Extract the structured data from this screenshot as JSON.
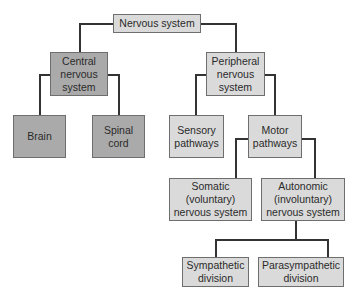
{
  "diagram": {
    "type": "hierarchy",
    "title": "Nervous system",
    "colors": {
      "cns_branch": "#aaaaaa",
      "pns_branch": "#dadada",
      "lines": "#333333"
    },
    "nodes": {
      "root": "Nervous system",
      "cns": "Central\nnervous\nsystem",
      "brain": "Brain",
      "spinal": "Spinal\ncord",
      "pns": "Peripheral\nnervous\nsystem",
      "sensory": "Sensory\npathways",
      "motor": "Motor\npathways",
      "somatic": "Somatic\n(voluntary)\nnervous system",
      "autonomic": "Autonomic\n(involuntary)\nnervous system",
      "sympathetic": "Sympathetic\ndivision",
      "parasympathetic": "Parasympathetic\ndivision"
    },
    "edges": [
      [
        "Nervous system",
        "Central nervous system"
      ],
      [
        "Nervous system",
        "Peripheral nervous system"
      ],
      [
        "Central nervous system",
        "Brain"
      ],
      [
        "Central nervous system",
        "Spinal cord"
      ],
      [
        "Peripheral nervous system",
        "Sensory pathways"
      ],
      [
        "Peripheral nervous system",
        "Motor pathways"
      ],
      [
        "Motor pathways",
        "Somatic (voluntary) nervous system"
      ],
      [
        "Motor pathways",
        "Autonomic (involuntary) nervous system"
      ],
      [
        "Autonomic (involuntary) nervous system",
        "Sympathetic division"
      ],
      [
        "Autonomic (involuntary) nervous system",
        "Parasympathetic division"
      ]
    ]
  }
}
